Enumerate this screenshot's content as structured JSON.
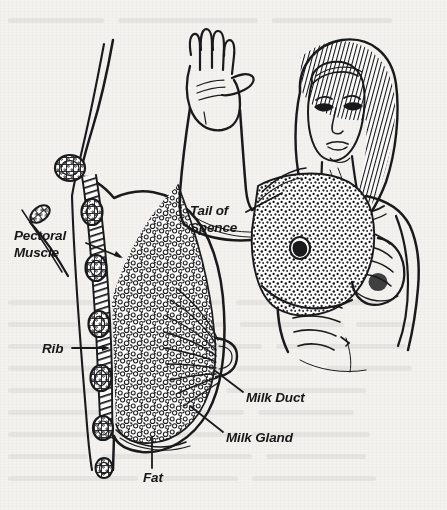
{
  "figure": {
    "kind": "anatomical-line-illustration",
    "background_color": "#f3f2ef",
    "ink_color": "#1a1a1c",
    "width": 447,
    "height": 510
  },
  "labels": [
    {
      "id": "pectoral-muscle",
      "text": "Pectoral\nMuscle",
      "x": 14,
      "y": 228,
      "lines": 2,
      "leader": {
        "from_x": 86,
        "from_y": 243,
        "to_x": 123,
        "to_y": 258,
        "arrow": true
      }
    },
    {
      "id": "rib",
      "text": "Rib",
      "x": 42,
      "y": 341,
      "lines": 1,
      "leader": {
        "from_x": 72,
        "from_y": 348,
        "to_x": 110,
        "to_y": 348,
        "arrow": true
      }
    },
    {
      "id": "tail-of-spence",
      "text": "Tail of\nSpence",
      "x": 190,
      "y": 203,
      "lines": 2,
      "leader": {
        "from_x": 246,
        "from_y": 212,
        "to_x": 282,
        "to_y": 193,
        "arrow": false
      }
    },
    {
      "id": "milk-duct",
      "text": "Milk Duct",
      "x": 246,
      "y": 390,
      "lines": 1,
      "leader": {
        "from_x": 243,
        "from_y": 392,
        "to_x": 214,
        "to_y": 370,
        "arrow": false
      }
    },
    {
      "id": "milk-gland",
      "text": "Milk Gland",
      "x": 226,
      "y": 430,
      "lines": 1,
      "leader": {
        "from_x": 223,
        "from_y": 432,
        "to_x": 190,
        "to_y": 406,
        "arrow": false
      }
    },
    {
      "id": "fat",
      "text": "Fat",
      "x": 143,
      "y": 470,
      "lines": 1,
      "leader": {
        "from_x": 152,
        "from_y": 468,
        "to_x": 152,
        "to_y": 437,
        "arrow": false
      }
    }
  ],
  "structures": [
    {
      "id": "cross-section",
      "name": "Sagittal breast cross-section",
      "side": "left"
    },
    {
      "id": "clavicle-section",
      "name": "Clavicle cross-section",
      "side": "left"
    },
    {
      "id": "rib-stack",
      "name": "Rib cross-sections",
      "count": 6,
      "side": "left"
    },
    {
      "id": "pectoral-band",
      "name": "Pectoralis major muscle band",
      "side": "left"
    },
    {
      "id": "glandular-tissue",
      "name": "Lobular glandular tissue",
      "side": "left"
    },
    {
      "id": "duct-fan",
      "name": "Lactiferous ducts converging to nipple",
      "side": "left"
    },
    {
      "id": "nipple",
      "name": "Nipple",
      "side": "left"
    },
    {
      "id": "woman-figure",
      "name": "Woman in self-exam position with raised left arm",
      "side": "right"
    },
    {
      "id": "raised-arm",
      "name": "Raised left arm with open palm",
      "side": "right"
    },
    {
      "id": "torso-cutaway",
      "name": "Chest cutaway showing ribs and breast tissue",
      "side": "right"
    },
    {
      "id": "intact-breast",
      "name": "Intact right breast",
      "side": "right"
    }
  ],
  "artifacts": [
    {
      "id": "scan-speck",
      "x": 345,
      "y": 340,
      "note": "small stray ink mark"
    }
  ]
}
